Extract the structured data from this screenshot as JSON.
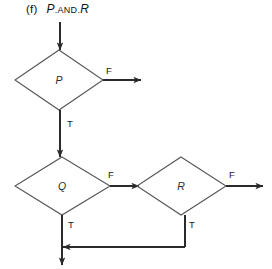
{
  "figure": {
    "label": "(f)",
    "expression_parts": {
      "left_operand": "P",
      "operator": ".AND.",
      "right_operand": "R"
    },
    "width": 272,
    "height": 269
  },
  "colors": {
    "background": "#ffffff",
    "diamond_stroke": "#555555",
    "connector": "#2a2a2a",
    "text": "#1a1a1a",
    "node_text": "#2b2b2b"
  },
  "nodes": [
    {
      "id": "decision-p",
      "label": "P",
      "shape": "diamond",
      "cx": 59,
      "cy": 80,
      "rx": 44,
      "ry": 30
    },
    {
      "id": "decision-q",
      "label": "Q",
      "shape": "diamond",
      "cx": 62,
      "cy": 186,
      "rx": 47,
      "ry": 29
    },
    {
      "id": "decision-r",
      "label": "R",
      "shape": "diamond",
      "cx": 181,
      "cy": 186,
      "rx": 44,
      "ry": 29
    }
  ],
  "edges": [
    {
      "id": "entry-to-p",
      "label": "",
      "from": "entry",
      "to": "decision-p",
      "arrow": "down"
    },
    {
      "id": "p-false-exit",
      "label": "F",
      "from": "decision-p",
      "to": "exit-right",
      "arrow": "right",
      "label_x": 110,
      "label_y": 71
    },
    {
      "id": "p-true-to-q",
      "label": "T",
      "from": "decision-p",
      "to": "decision-q",
      "arrow": "down",
      "label_x": 68,
      "label_y": 124
    },
    {
      "id": "q-false-to-r",
      "label": "F",
      "from": "decision-q",
      "to": "decision-r",
      "arrow": "right",
      "label_x": 112,
      "label_y": 175
    },
    {
      "id": "q-true-down",
      "label": "T",
      "from": "decision-q",
      "to": "merge-junction",
      "arrow": "none",
      "label_x": 68,
      "label_y": 225
    },
    {
      "id": "r-false-exit",
      "label": "F",
      "from": "decision-r",
      "to": "exit-right",
      "arrow": "right",
      "label_x": 232,
      "label_y": 175
    },
    {
      "id": "r-true-to-merge",
      "label": "T",
      "from": "decision-r",
      "to": "merge-junction",
      "arrow": "left",
      "label_x": 191,
      "label_y": 225
    },
    {
      "id": "merge-exit-down",
      "label": "",
      "from": "merge-junction",
      "to": "exit-bottom",
      "arrow": "down"
    }
  ],
  "edge_labels": {
    "true": "T",
    "false": "F"
  }
}
